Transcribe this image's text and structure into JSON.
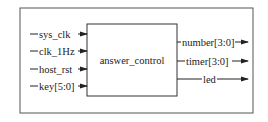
{
  "diagram": {
    "module_name": "answer_control",
    "inputs": [
      "sys_clk",
      "clk_1Hz",
      "host_rst",
      "key[5:0]"
    ],
    "outputs": [
      "number[3:0]",
      "timer[3:0]",
      "led"
    ]
  }
}
